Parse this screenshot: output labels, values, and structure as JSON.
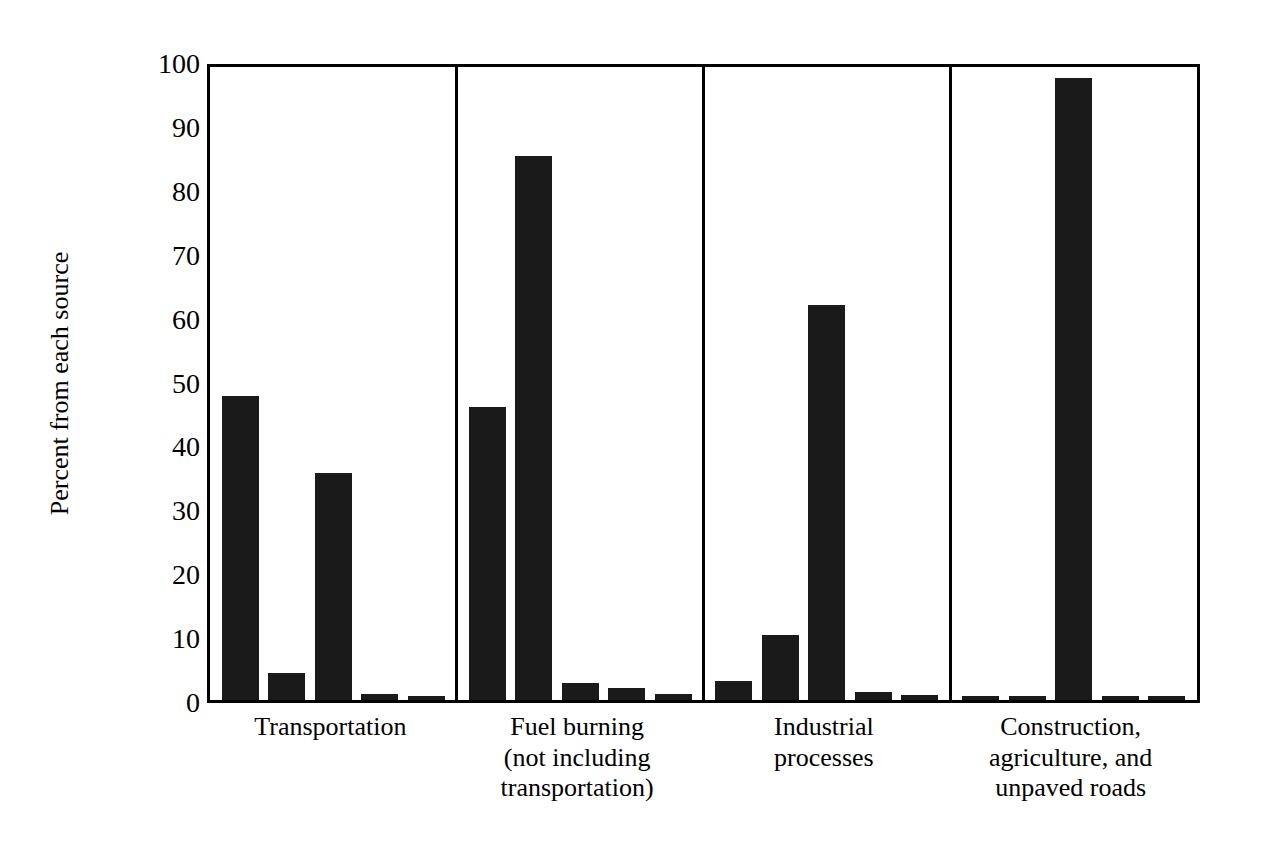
{
  "chart_data": {
    "type": "bar",
    "title": "",
    "subtitle": "",
    "xlabel": "",
    "ylabel": "Percent from each source",
    "ylim": [
      0,
      100
    ],
    "yticks": [
      0,
      10,
      20,
      30,
      40,
      50,
      60,
      70,
      80,
      90,
      100
    ],
    "ytick_labels": [
      "0",
      "10",
      "20",
      "30",
      "40",
      "50",
      "60",
      "70",
      "80",
      "90",
      "100"
    ],
    "grid": false,
    "legend": null,
    "legend_position": "none",
    "bar_color": "#1a1a1a",
    "axis_color": "#000000",
    "background_color": "#ffffff",
    "groups": [
      {
        "label": "Transportation",
        "label_lines": [
          "Transportation"
        ],
        "values": [
          47.5,
          4.2,
          35.5,
          0.9,
          0.6
        ]
      },
      {
        "label": "Fuel burning (not including transportation)",
        "label_lines": [
          "Fuel burning",
          "(not including",
          "transportation)"
        ],
        "values": [
          45.8,
          85.2,
          2.6,
          1.9,
          1.0
        ]
      },
      {
        "label": "Industrial processes",
        "label_lines": [
          "Industrial",
          "processes"
        ],
        "values": [
          3.0,
          10.2,
          61.8,
          1.3,
          0.8
        ]
      },
      {
        "label": "Construction, agriculture, and unpaved roads",
        "label_lines": [
          "Construction,",
          "agriculture, and",
          "unpaved roads"
        ],
        "values": [
          0.7,
          0.7,
          97.3,
          0.7,
          0.7
        ]
      }
    ],
    "bars_per_group": 5,
    "categories": [
      "Transportation",
      "Fuel burning (not including transportation)",
      "Industrial processes",
      "Construction, agriculture, and unpaved roads"
    ],
    "series": [
      {
        "name": "bar-1",
        "values": [
          47.5,
          45.8,
          3.0,
          0.7
        ]
      },
      {
        "name": "bar-2",
        "values": [
          4.2,
          85.2,
          10.2,
          0.7
        ]
      },
      {
        "name": "bar-3",
        "values": [
          35.5,
          2.6,
          61.8,
          97.3
        ]
      },
      {
        "name": "bar-4",
        "values": [
          0.9,
          1.9,
          1.3,
          0.7
        ]
      },
      {
        "name": "bar-5",
        "values": [
          0.6,
          1.0,
          0.8,
          0.7
        ]
      }
    ]
  }
}
